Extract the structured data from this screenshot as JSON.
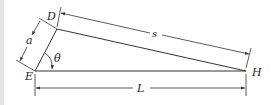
{
  "diagram": {
    "type": "geometry-dimension-figure",
    "points": {
      "E": {
        "label": "E",
        "x": 35,
        "y": 71
      },
      "D": {
        "label": "D",
        "x": 57,
        "y": 29
      },
      "H": {
        "label": "H",
        "x": 246,
        "y": 71
      }
    },
    "segments": [
      {
        "from": "E",
        "to": "D",
        "name": "short-side"
      },
      {
        "from": "D",
        "to": "H",
        "name": "hypotenuse"
      },
      {
        "from": "E",
        "to": "H",
        "name": "base"
      }
    ],
    "dimensions": {
      "a": {
        "label": "a",
        "measures": "E-D"
      },
      "s": {
        "label": "s",
        "measures": "D-H"
      },
      "L": {
        "label": "L",
        "measures": "E-H"
      }
    },
    "angle": {
      "label": "θ",
      "vertex": "E",
      "between": [
        "E-D",
        "E-H"
      ]
    }
  },
  "colors": {
    "line": "#333333",
    "background": "#ffffff",
    "edge_strip": "#e4e4e4"
  }
}
